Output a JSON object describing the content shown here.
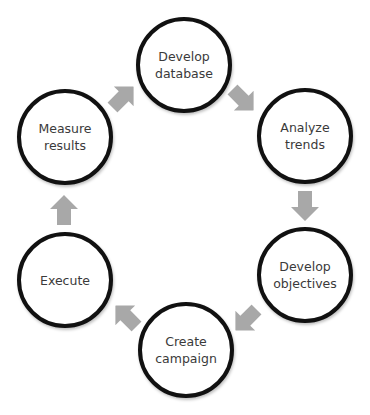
{
  "diagram": {
    "type": "cycle",
    "arrow_color": "#a8a8a8",
    "circle_border_color": "#111111",
    "text_color": "#3a3a3a",
    "nodes": [
      {
        "id": "develop-database",
        "label": "Develop\ndatabase",
        "cx": 184,
        "cy": 65
      },
      {
        "id": "analyze-trends",
        "label": "Analyze\ntrends",
        "cx": 305,
        "cy": 136
      },
      {
        "id": "develop-objectives",
        "label": "Develop\nobjectives",
        "cx": 305,
        "cy": 275
      },
      {
        "id": "create-campaign",
        "label": "Create\ncampaign",
        "cx": 186,
        "cy": 350
      },
      {
        "id": "execute",
        "label": "Execute",
        "cx": 65,
        "cy": 280
      },
      {
        "id": "measure-results",
        "label": "Measure\nresults",
        "cx": 65,
        "cy": 137
      }
    ],
    "edges": [
      {
        "from": "develop-database",
        "to": "analyze-trends"
      },
      {
        "from": "analyze-trends",
        "to": "develop-objectives"
      },
      {
        "from": "develop-objectives",
        "to": "create-campaign"
      },
      {
        "from": "create-campaign",
        "to": "execute"
      },
      {
        "from": "execute",
        "to": "measure-results"
      },
      {
        "from": "measure-results",
        "to": "develop-database"
      }
    ]
  }
}
